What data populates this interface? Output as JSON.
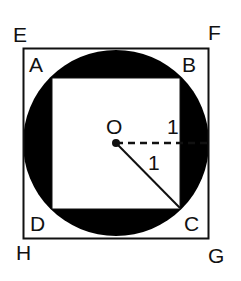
{
  "figure": {
    "type": "geometry-diagram",
    "colors": {
      "fill": "#000000",
      "stroke": "#111111",
      "background": "#ffffff"
    },
    "outer_square": {
      "vertices": [
        "E",
        "F",
        "G",
        "H"
      ],
      "labels": {
        "E": "E",
        "F": "F",
        "G": "G",
        "H": "H"
      }
    },
    "inner_square": {
      "vertices": [
        "A",
        "B",
        "C",
        "D"
      ],
      "labels": {
        "A": "A",
        "B": "B",
        "C": "C",
        "D": "D"
      }
    },
    "circle": {
      "center_label": "O",
      "shaded": "region between circle and inner square"
    },
    "segments": [
      {
        "from": "O",
        "to": "right side of circle",
        "style": "dashed",
        "label": "1"
      },
      {
        "from": "O",
        "to": "C",
        "style": "solid",
        "label": "1"
      }
    ]
  }
}
